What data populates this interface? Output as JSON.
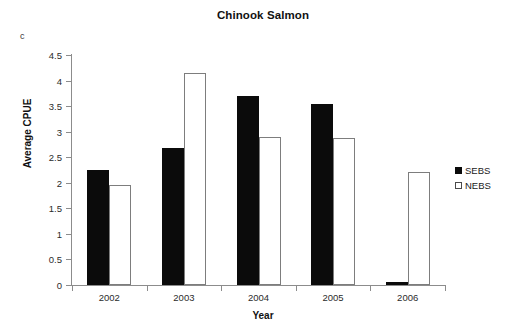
{
  "panel_label": "c",
  "legend": {
    "position": "right",
    "items": [
      {
        "label": "SEBS",
        "marker": "filled-square",
        "color": "#0b0b0b"
      },
      {
        "label": "NEBS",
        "marker": "open-square",
        "color": "#ffffff"
      }
    ]
  },
  "axes": {
    "x_title": "Year",
    "y_title": "Average CPUE"
  },
  "chart_data": {
    "type": "bar",
    "title": "Chinook Salmon",
    "xlabel": "Year",
    "ylabel": "Average CPUE",
    "categories": [
      "2002",
      "2003",
      "2004",
      "2005",
      "2006"
    ],
    "series": [
      {
        "name": "SEBS",
        "color": "#0b0b0b",
        "values": [
          2.25,
          2.68,
          3.7,
          3.55,
          0.06
        ]
      },
      {
        "name": "NEBS",
        "color": "#ffffff",
        "values": [
          1.95,
          4.15,
          2.9,
          2.87,
          2.22
        ]
      }
    ],
    "ylim": [
      0,
      4.5
    ],
    "ytick_labels": [
      "0",
      "0.5",
      "1",
      "1.5",
      "2",
      "2.5",
      "3",
      "3.5",
      "4",
      "4.5"
    ],
    "ytick_values": [
      0,
      0.5,
      1,
      1.5,
      2,
      2.5,
      3,
      3.5,
      4,
      4.5
    ],
    "grid": false,
    "legend_position": "right"
  }
}
